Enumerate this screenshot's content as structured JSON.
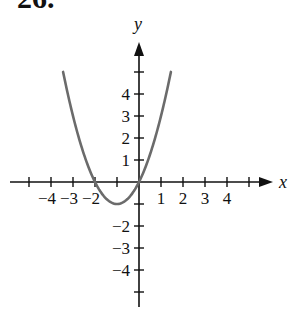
{
  "problem": {
    "number": "26."
  },
  "chart_data": {
    "type": "line",
    "title": "",
    "xlabel": "x",
    "ylabel": "y",
    "xlim": [
      -5.5,
      6
    ],
    "ylim": [
      -5.5,
      6
    ],
    "grid": false,
    "x_tick_values": [
      -5,
      -4,
      -3,
      -2,
      -1,
      1,
      2,
      3,
      4,
      5
    ],
    "x_tick_labels": [
      {
        "value": -4,
        "text": "−4"
      },
      {
        "value": -3,
        "text": "−3"
      },
      {
        "value": -2,
        "text": "−2"
      },
      {
        "value": 1,
        "text": "1"
      },
      {
        "value": 2,
        "text": "2"
      },
      {
        "value": 3,
        "text": "3"
      },
      {
        "value": 4,
        "text": "4"
      }
    ],
    "y_tick_values": [
      -5,
      -4,
      -3,
      -2,
      -1,
      1,
      2,
      3,
      4,
      5
    ],
    "y_tick_labels": [
      {
        "value": 4,
        "text": "4"
      },
      {
        "value": 3,
        "text": "3"
      },
      {
        "value": 2,
        "text": "2"
      },
      {
        "value": 1,
        "text": "1"
      },
      {
        "value": -2,
        "text": "−2"
      },
      {
        "value": -3,
        "text": "−3"
      },
      {
        "value": -4,
        "text": "−4"
      }
    ],
    "series": [
      {
        "name": "parabola",
        "description": "upward-opening parabola with vertex (-1, -1), x-intercepts at -2 and 0",
        "equation": "y = x^2 + 2x",
        "x_range": [
          -3.45,
          1.45
        ],
        "key_points": [
          [
            -2,
            0
          ],
          [
            -1,
            -1
          ],
          [
            0,
            0
          ]
        ],
        "color": "#6b6b6b"
      }
    ]
  },
  "style": {
    "axis_color": "#111111",
    "curve_color": "#6b6b6b"
  },
  "layout": {
    "origin_px": [
      139,
      182
    ],
    "unit_px": 22,
    "x_axis_px": [
      10,
      273
    ],
    "y_axis_px": [
      42,
      307
    ]
  }
}
